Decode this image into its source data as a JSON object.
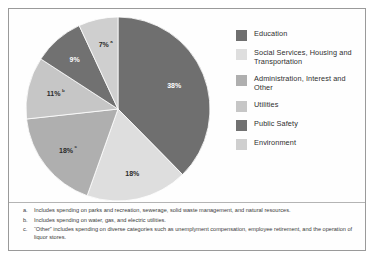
{
  "chart_data": {
    "type": "pie",
    "title": "",
    "subtitle": "",
    "legend_position": "right",
    "grid": false,
    "categories": [
      "Education",
      "Social Services, Housing and Transportation",
      "Administration, Interest and Other",
      "Utilities",
      "Public Safety",
      "Environment"
    ],
    "values": [
      38,
      18,
      18,
      11,
      9,
      7
    ],
    "value_labels": [
      "38%",
      "18%",
      "18%",
      "11%",
      "9%",
      "7%"
    ],
    "slice_footnote_markers": [
      "",
      "",
      "c",
      "b",
      "",
      "a"
    ],
    "colors": [
      "#6f6f6f",
      "#dedede",
      "#afafaf",
      "#c6c6c6",
      "#717171",
      "#cfcfcf"
    ],
    "label_text_light": [
      true,
      false,
      false,
      false,
      true,
      false
    ],
    "start_angle_deg": 0,
    "direction": "clockwise"
  },
  "legend": {
    "items": [
      {
        "label": "Education",
        "color": "#6f6f6f"
      },
      {
        "label": "Social Services, Housing and Transportation",
        "color": "#dedede"
      },
      {
        "label": "Administration, Interest and Other",
        "color": "#afafaf"
      },
      {
        "label": "Utilities",
        "color": "#c6c6c6"
      },
      {
        "label": "Public Safety",
        "color": "#717171"
      },
      {
        "label": "Environment",
        "color": "#cfcfcf"
      }
    ]
  },
  "slice_labels": [
    {
      "value": "38%",
      "note": ""
    },
    {
      "value": "18%",
      "note": ""
    },
    {
      "value": "18%",
      "note": "c"
    },
    {
      "value": "11%",
      "note": "b"
    },
    {
      "value": "9%",
      "note": ""
    },
    {
      "value": "7%",
      "note": "a"
    }
  ],
  "notes": [
    {
      "marker": "a.",
      "text": "Includes spending on parks and recreation, sewerage, solid waste management, and natural resources."
    },
    {
      "marker": "b.",
      "text": "Includes spending on water, gas, and electric utilities."
    },
    {
      "marker": "c.",
      "text": "“Other” includes spending on diverse categories such as unemplyment compensation, employee retirement, and the operation of liquor stores."
    }
  ]
}
